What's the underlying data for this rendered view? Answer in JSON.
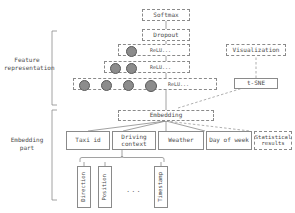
{
  "diagram": {
    "colors": {
      "stroke": "#8a8a8a",
      "text": "#4a4a4a",
      "neuron_fill": "#8c8c8c",
      "neuron_stroke": "#5a5a5a",
      "background": "#ffffff"
    }
  },
  "sections": {
    "feature_representation": "Feature\nrepresentation",
    "embedding_part": "Embedding\npart"
  },
  "stack": {
    "softmax": "Softmax",
    "dropout": "Dropout",
    "relu_1": "ReLU...",
    "relu_2": "ReLU...",
    "relu_3": "ReLU...",
    "embedding": "Embedding"
  },
  "neuron_counts": {
    "relu_1": 1,
    "relu_2": 2,
    "relu_3": 4
  },
  "visualization_branch": {
    "visualization": "Visualization",
    "tsne": "t-SNE"
  },
  "inputs": [
    {
      "label": "Taxi id",
      "style": "solid"
    },
    {
      "label": "Driving\ncontext",
      "style": "solid"
    },
    {
      "label": "Weather",
      "style": "solid"
    },
    {
      "label": "Day of week",
      "style": "solid"
    },
    {
      "label": "Statistical\nresults",
      "style": "dashed"
    }
  ],
  "driving_context_features": [
    {
      "label": "Direction"
    },
    {
      "label": "Position"
    },
    {
      "label": "Timestamp"
    }
  ],
  "ellipsis": "..."
}
